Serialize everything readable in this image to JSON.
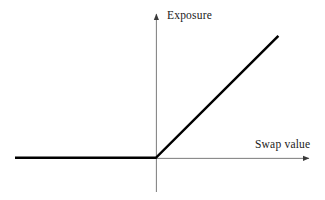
{
  "chart_data": {
    "type": "line",
    "title": "",
    "xlabel": "Swap value",
    "ylabel": "Exposure",
    "grid": false,
    "legend": null,
    "xlim": [
      -1.15,
      1.25
    ],
    "ylim": [
      -0.28,
      1.18
    ],
    "annotations": [],
    "series": [
      {
        "name": "Exposure payoff",
        "description": "max(swap value, 0): flat at zero for negative swap values, then rising linearly with slope 1 for positive swap values",
        "color": "#000000",
        "linewidth": 2.5,
        "x": [
          -1.15,
          0.0,
          1.0
        ],
        "y": [
          0.0,
          0.0,
          1.0
        ]
      }
    ],
    "axes": {
      "x_axis": {
        "color": "#7a7a7a",
        "linewidth": 1,
        "arrow": "right",
        "from": [
          -1.15,
          0.0
        ],
        "to": [
          1.25,
          0.0
        ]
      },
      "y_axis": {
        "color": "#7a7a7a",
        "linewidth": 1,
        "arrow": "up",
        "from": [
          0.0,
          -0.28
        ],
        "to": [
          0.0,
          1.18
        ]
      }
    },
    "ticks": {
      "x": [],
      "y": []
    }
  },
  "labels": {
    "y_axis": "Exposure",
    "x_axis": "Swap value"
  },
  "colors": {
    "background": "#ffffff",
    "axis": "#7a7a7a",
    "curve": "#000000",
    "text": "#1a1a1a"
  }
}
